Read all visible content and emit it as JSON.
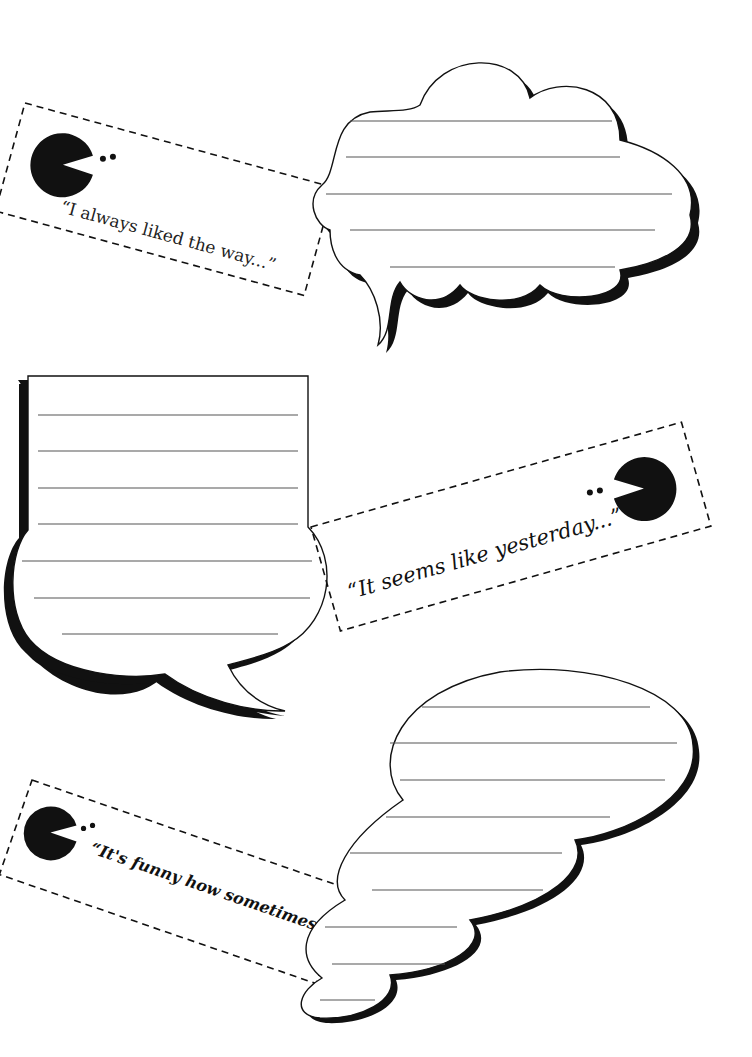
{
  "worksheet": {
    "colors": {
      "ink": "#111111",
      "rule": "#555555",
      "paper": "#ffffff"
    },
    "panels": [
      {
        "id": "panel-1",
        "prompt": "“I always liked the way...”",
        "icon": "pacman-icon",
        "bubble_shape": "cloud-speech-bubble",
        "writing_lines": 5
      },
      {
        "id": "panel-2",
        "prompt": "“It seems like yesterday...”",
        "icon": "pacman-icon",
        "bubble_shape": "rounded-speech-bubble",
        "writing_lines": 7
      },
      {
        "id": "panel-3",
        "prompt": "“It's funny how sometimes...”",
        "icon": "pacman-icon",
        "bubble_shape": "thought-bubble",
        "writing_lines": 9
      }
    ]
  }
}
